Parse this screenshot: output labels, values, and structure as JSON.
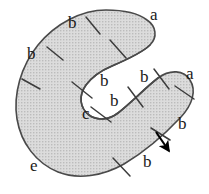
{
  "figure": {
    "kind": "spiral-region-diagram",
    "background_color": "#ffffff",
    "fill_color": "#d2d2d2",
    "stroke_color": "#4a4a4a",
    "label_color": "#1a1a1a",
    "tick_color": "#3c3c3c",
    "arrow_color": "#000000",
    "canvas": {
      "width": 209,
      "height": 194
    }
  },
  "labels": [
    {
      "id": "a-top",
      "text": "a",
      "x": 150,
      "y": 6,
      "name": "edge-label-a-top"
    },
    {
      "id": "b-top",
      "text": "b",
      "x": 68,
      "y": 14,
      "name": "edge-label-b-top"
    },
    {
      "id": "b-left",
      "text": "b",
      "x": 27,
      "y": 45,
      "name": "edge-label-b-left"
    },
    {
      "id": "b-mid1",
      "text": "b",
      "x": 100,
      "y": 72,
      "name": "edge-label-b-center-upper"
    },
    {
      "id": "b-mid2",
      "text": "b",
      "x": 140,
      "y": 68,
      "name": "edge-label-b-inner-right"
    },
    {
      "id": "a-right",
      "text": "a",
      "x": 186,
      "y": 65,
      "name": "edge-label-a-right"
    },
    {
      "id": "b-mid3",
      "text": "b",
      "x": 110,
      "y": 92,
      "name": "edge-label-b-center-lower"
    },
    {
      "id": "c-inner",
      "text": "c",
      "x": 82,
      "y": 105,
      "name": "edge-label-c-inner"
    },
    {
      "id": "b-rightlow",
      "text": "b",
      "x": 178,
      "y": 115,
      "name": "edge-label-b-right-lower"
    },
    {
      "id": "b-bottom",
      "text": "b",
      "x": 143,
      "y": 153,
      "name": "edge-label-b-bottom"
    },
    {
      "id": "e-left",
      "text": "e",
      "x": 30,
      "y": 157,
      "name": "edge-label-e-bottom-left"
    }
  ],
  "ticks": [
    {
      "id": "t1",
      "x1": 86,
      "y1": 17,
      "x2": 100,
      "y2": 34
    },
    {
      "id": "t2",
      "x1": 47,
      "y1": 47,
      "x2": 63,
      "y2": 60
    },
    {
      "id": "t3",
      "x1": 22,
      "y1": 79,
      "x2": 40,
      "y2": 89
    },
    {
      "id": "t4",
      "x1": 110,
      "y1": 40,
      "x2": 126,
      "y2": 58
    },
    {
      "id": "t5",
      "x1": 72,
      "y1": 82,
      "x2": 92,
      "y2": 98
    },
    {
      "id": "t6",
      "x1": 91,
      "y1": 107,
      "x2": 111,
      "y2": 122
    },
    {
      "id": "t7",
      "x1": 128,
      "y1": 87,
      "x2": 143,
      "y2": 107
    },
    {
      "id": "t8",
      "x1": 154,
      "y1": 69,
      "x2": 169,
      "y2": 89
    },
    {
      "id": "t9",
      "x1": 175,
      "y1": 86,
      "x2": 194,
      "y2": 99
    },
    {
      "id": "t10",
      "x1": 151,
      "y1": 128,
      "x2": 170,
      "y2": 140
    },
    {
      "id": "t11",
      "x1": 113,
      "y1": 158,
      "x2": 130,
      "y2": 176
    }
  ],
  "arrow": {
    "name": "orientation-arrow",
    "tail_x": 156,
    "tail_y": 132,
    "tip_x": 169,
    "tip_y": 151
  }
}
